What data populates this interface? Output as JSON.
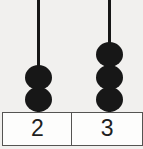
{
  "figure": {
    "name": "abacus-bead-count",
    "background_color": "#f1f0ee",
    "bead_color": "#171717",
    "rod_color": "#161616",
    "box_border_color": "#555452",
    "box_fill_color": "#fdfdfc",
    "label_text_color": "#1e1e1e"
  },
  "columns": [
    {
      "id": "column-left",
      "bead_count": 2,
      "label": "2",
      "beads": [
        {
          "index": 0,
          "position": "bottom"
        },
        {
          "index": 1,
          "position": "middle"
        }
      ]
    },
    {
      "id": "column-right",
      "bead_count": 3,
      "label": "3",
      "beads": [
        {
          "index": 0,
          "position": "bottom"
        },
        {
          "index": 1,
          "position": "middle"
        },
        {
          "index": 2,
          "position": "top"
        }
      ]
    }
  ],
  "labels": {
    "left": "2",
    "right": "3"
  }
}
